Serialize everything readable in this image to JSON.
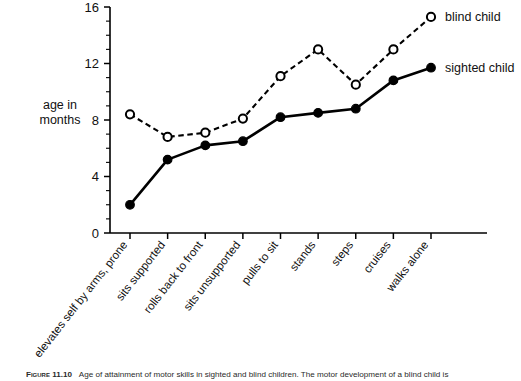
{
  "figure": {
    "caption_label": "Figure 11.10",
    "caption_text": "Age of attainment of motor skills in sighted and blind children. The motor development of a blind child is"
  },
  "axes": {
    "y_title_line1": "age in",
    "y_title_line2": "months",
    "y_ticklabels": [
      "0",
      "4",
      "8",
      "12",
      "16"
    ],
    "y_tickvalues": [
      0,
      4,
      8,
      12,
      16
    ]
  },
  "legend": {
    "entries": [
      {
        "label": "blind child",
        "marker": "open-circle",
        "line": "dashed",
        "color": "#000000"
      },
      {
        "label": "sighted child",
        "marker": "filled-circle",
        "line": "solid",
        "color": "#000000"
      }
    ]
  },
  "chart_data": {
    "type": "line",
    "title": "",
    "xlabel": "",
    "ylabel": "age in months",
    "ylim": [
      0,
      16
    ],
    "ytick_major_step": 4,
    "ytick_minor_step": 1,
    "grid": false,
    "legend_position": "right",
    "categories": [
      "elevates self by arms, prone",
      "sits supported",
      "rolls back to front",
      "sits unsupported",
      "pulls to sit",
      "stands",
      "steps",
      "cruises",
      "walks alone"
    ],
    "series": [
      {
        "name": "blind child",
        "marker": "open-circle",
        "linestyle": "dashed",
        "values": [
          8.4,
          6.8,
          7.1,
          8.1,
          11.1,
          13.0,
          10.5,
          13.0,
          15.3
        ]
      },
      {
        "name": "sighted child",
        "marker": "filled-circle",
        "linestyle": "solid",
        "values": [
          2.0,
          5.2,
          6.2,
          6.5,
          8.2,
          8.5,
          8.8,
          10.8,
          11.7
        ]
      }
    ]
  }
}
